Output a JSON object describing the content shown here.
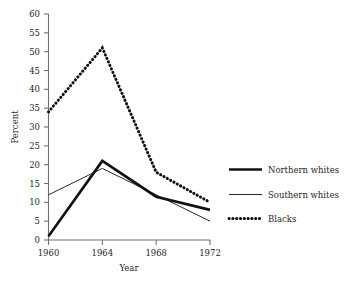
{
  "chart_data": {
    "type": "line",
    "title": "",
    "xlabel": "Year",
    "ylabel": "Percent",
    "categories": [
      "1960",
      "1964",
      "1968",
      "1972"
    ],
    "x": [
      1960,
      1964,
      1968,
      1972
    ],
    "xlim": [
      1960,
      1972
    ],
    "ylim": [
      0,
      60
    ],
    "ytick_step": 5,
    "yticks": [
      "0",
      "5",
      "10",
      "15",
      "20",
      "25",
      "30",
      "35",
      "40",
      "45",
      "50",
      "55",
      "60"
    ],
    "xticks": [
      "1960",
      "1964",
      "1968",
      "1972"
    ],
    "grid": false,
    "legend_position": "right",
    "series": [
      {
        "name": "Northern whites",
        "style": "thick-solid",
        "values": [
          1,
          21,
          11.5,
          8
        ]
      },
      {
        "name": "Southern whites",
        "style": "thin-solid",
        "values": [
          12,
          19,
          12,
          5
        ]
      },
      {
        "name": "Blacks",
        "style": "thick-dotted",
        "values": [
          34,
          51,
          18,
          10
        ]
      }
    ]
  },
  "axes": {
    "y_title": "Percent",
    "x_title": "Year"
  },
  "legend": {
    "entries": [
      {
        "label": "Northern whites",
        "swatch": "thick-solid-line-icon"
      },
      {
        "label": "Southern whites",
        "swatch": "thin-solid-line-icon"
      },
      {
        "label": "Blacks",
        "swatch": "dotted-line-icon"
      }
    ]
  },
  "colors": {
    "ink": "#111111",
    "axis": "#6f6f6f",
    "background": "#ffffff"
  }
}
